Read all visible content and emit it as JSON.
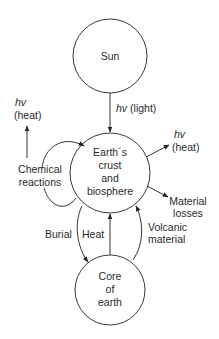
{
  "diagram": {
    "nodes": [
      {
        "id": "sun",
        "label_lines": [
          "Sun"
        ]
      },
      {
        "id": "earth",
        "label_lines": [
          "Earth´s",
          "crust",
          "and",
          "biosphere"
        ]
      },
      {
        "id": "core",
        "label_lines": [
          "Core",
          "of",
          "earth"
        ]
      }
    ],
    "edges": {
      "sun_to_earth": {
        "symbol": "hv",
        "label": "(light)"
      },
      "chem_heat": {
        "symbol": "hv",
        "label": "(heat)"
      },
      "chemical_reactions": {
        "lines": [
          "Chemical",
          "reactions"
        ]
      },
      "earth_heat": {
        "symbol": "hv",
        "label": "(heat)"
      },
      "material_losses": {
        "lines": [
          "Material",
          "losses"
        ]
      },
      "burial": {
        "label": "Burial"
      },
      "heat": {
        "label": "Heat"
      },
      "volcanic": {
        "lines": [
          "Volcanic",
          "material"
        ]
      }
    }
  }
}
